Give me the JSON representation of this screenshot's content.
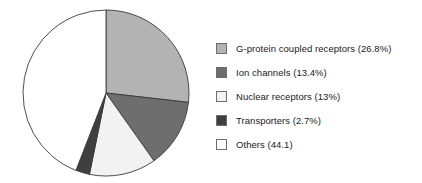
{
  "chart_data": {
    "type": "pie",
    "title": "",
    "subtitle": "",
    "xlabel": "",
    "ylabel": "",
    "grid": false,
    "legend_position": "right",
    "start_angle_deg": 0,
    "direction": "clockwise",
    "categories": [
      "G-protein coupled receptors",
      "Ion channels",
      "Nuclear receptors",
      "Transporters",
      "Others"
    ],
    "values": [
      26.8,
      13.4,
      13,
      2.7,
      44.1
    ],
    "value_unit": "%",
    "slice_colors": [
      "#b3b3b3",
      "#6e6e6e",
      "#f2f2f2",
      "#3f3f3f",
      "#ffffff"
    ],
    "slice_edge_color": "#3a3a3a",
    "labels": [
      "G-protein coupled receptors (26.8%)",
      "Ion channels (13.4%)",
      "Nuclear receptors (13%)",
      "Transporters (2.7%)",
      "Others (44.1)"
    ]
  },
  "legend": {
    "items": [
      {
        "label": "G-protein coupled receptors (26.8%)",
        "color": "#b3b3b3",
        "name": "g-protein-coupled-receptors"
      },
      {
        "label": "Ion channels (13.4%)",
        "color": "#6e6e6e",
        "name": "ion-channels"
      },
      {
        "label": "Nuclear receptors (13%)",
        "color": "#f2f2f2",
        "name": "nuclear-receptors"
      },
      {
        "label": "Transporters (2.7%)",
        "color": "#3f3f3f",
        "name": "transporters"
      },
      {
        "label": "Others (44.1)",
        "color": "#ffffff",
        "name": "others"
      }
    ]
  },
  "pie_geometry": {
    "cx": 106,
    "cy": 93,
    "r": 83
  }
}
